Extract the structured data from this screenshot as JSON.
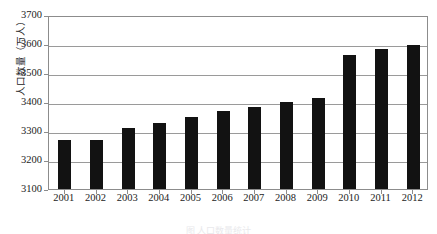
{
  "chart_data": {
    "type": "bar",
    "title": "",
    "xlabel": "",
    "ylabel": "人口数量（万人）",
    "categories": [
      "2001",
      "2002",
      "2003",
      "2004",
      "2005",
      "2006",
      "2007",
      "2008",
      "2009",
      "2010",
      "2011",
      "2012"
    ],
    "values": [
      3268,
      3268,
      3311,
      3329,
      3350,
      3368,
      3382,
      3400,
      3415,
      3563,
      3582,
      3598
    ],
    "ylim": [
      3100,
      3700
    ],
    "yticks": [
      3100,
      3200,
      3300,
      3400,
      3500,
      3600,
      3700
    ],
    "ytick_labels": [
      "3100",
      "3200",
      "3300",
      "3400",
      "3500",
      "3600",
      "3700"
    ],
    "grid": true,
    "legend": "none",
    "bar_color": "#121212",
    "grid_color": "#9a9a9a",
    "axis_color": "#8c8c8c"
  },
  "figure": {
    "caption": "图 人口数量统计"
  }
}
